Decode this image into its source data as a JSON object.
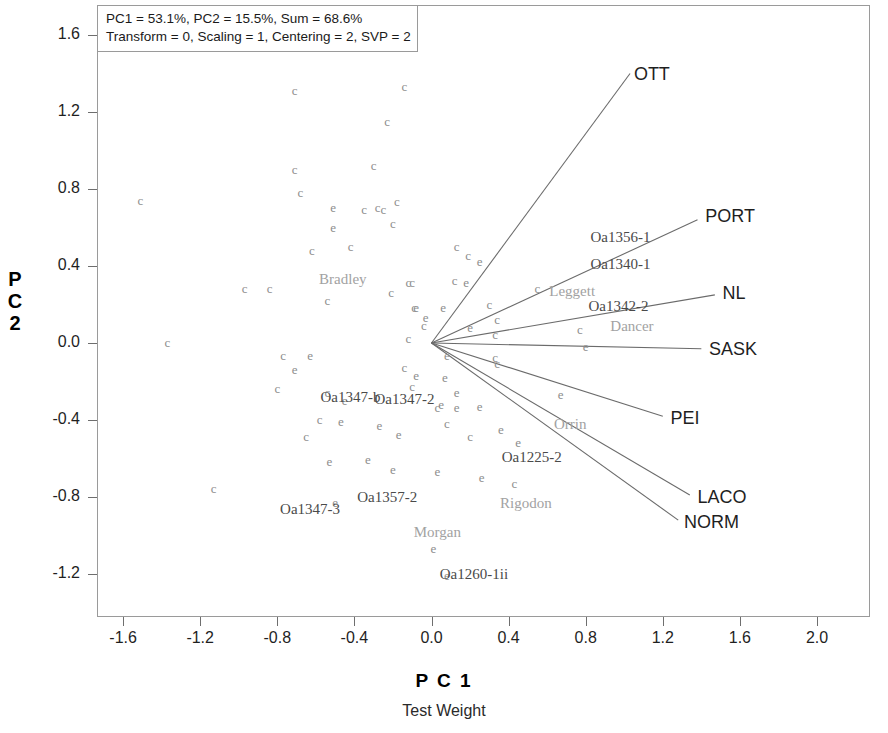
{
  "chart_data": {
    "type": "scatter",
    "title": "",
    "subtitle": "Test Weight",
    "xlabel": "P C 1",
    "ylabel": "P C 2",
    "xlim": [
      -1.85,
      2.2
    ],
    "ylim": [
      -1.42,
      1.75
    ],
    "xticks": [
      -1.6,
      -1.2,
      -0.8,
      -0.4,
      0.0,
      0.4,
      0.8,
      1.2,
      1.6,
      2.0
    ],
    "xtick_labels": [
      "-1.6",
      "-1.2",
      "-0.8",
      "-0.4",
      "0.0",
      "0.4",
      "0.8",
      "1.2",
      "1.6",
      "2.0"
    ],
    "yticks": [
      1.6,
      1.2,
      0.8,
      0.4,
      0.0,
      -0.4,
      -0.8,
      -1.2
    ],
    "ytick_labels": [
      "1.6",
      "1.2",
      "0.8",
      "0.4",
      "0.0",
      "-0.4",
      "-0.8",
      "-1.2"
    ],
    "grid": false,
    "legend": "none",
    "annotation_lines": [
      "PC1 = 53.1%, PC2 = 15.5%, Sum = 68.6%",
      "Transform = 0, Scaling = 1, Centering = 2, SVP = 2"
    ],
    "variance": {
      "pc1_percent": 53.1,
      "pc2_percent": 15.5,
      "sum_percent": 68.6
    },
    "settings": {
      "transform": 0,
      "scaling": 1,
      "centering": 2,
      "svp": 2
    },
    "vector_origin": [
      0.0,
      0.0
    ],
    "vectors": [
      {
        "name": "OTT",
        "x": 1.03,
        "y": 1.4,
        "label_x": 1.05,
        "label_y": 1.4
      },
      {
        "name": "PORT",
        "x": 1.38,
        "y": 0.64,
        "label_x": 1.42,
        "label_y": 0.66
      },
      {
        "name": "NL",
        "x": 1.47,
        "y": 0.25,
        "label_x": 1.51,
        "label_y": 0.26
      },
      {
        "name": "SASK",
        "x": 1.4,
        "y": -0.03,
        "label_x": 1.44,
        "label_y": -0.03
      },
      {
        "name": "PEI",
        "x": 1.2,
        "y": -0.38,
        "label_x": 1.24,
        "label_y": -0.39
      },
      {
        "name": "LACO",
        "x": 1.34,
        "y": -0.79,
        "label_x": 1.38,
        "label_y": -0.8
      },
      {
        "name": "NORM",
        "x": 1.28,
        "y": -0.92,
        "label_x": 1.31,
        "label_y": -0.93
      }
    ],
    "genotype_labels": [
      {
        "text": "Bradley",
        "x": -0.46,
        "y": 0.33,
        "shade": "light"
      },
      {
        "text": "Oa1356-1",
        "x": 0.98,
        "y": 0.55,
        "shade": "dark"
      },
      {
        "text": "Oa1340-1",
        "x": 0.98,
        "y": 0.41,
        "shade": "dark"
      },
      {
        "text": "Leggett",
        "x": 0.73,
        "y": 0.27,
        "shade": "light"
      },
      {
        "text": "Oa1342-2",
        "x": 0.97,
        "y": 0.19,
        "shade": "dark"
      },
      {
        "text": "Dancer",
        "x": 1.04,
        "y": 0.09,
        "shade": "light"
      },
      {
        "text": "Oa1347-b",
        "x": -0.42,
        "y": -0.28,
        "shade": "dark"
      },
      {
        "text": "Oa1347-2",
        "x": -0.14,
        "y": -0.29,
        "shade": "dark"
      },
      {
        "text": "Orrin",
        "x": 0.72,
        "y": -0.42,
        "shade": "light"
      },
      {
        "text": "Oa1225-2",
        "x": 0.52,
        "y": -0.59,
        "shade": "dark"
      },
      {
        "text": "Rigodon",
        "x": 0.49,
        "y": -0.83,
        "shade": "light"
      },
      {
        "text": "Oa1357-2",
        "x": -0.23,
        "y": -0.8,
        "shade": "dark"
      },
      {
        "text": "Oa1347-3",
        "x": -0.63,
        "y": -0.86,
        "shade": "dark"
      },
      {
        "text": "Morgan",
        "x": 0.03,
        "y": -0.98,
        "shade": "light"
      },
      {
        "text": "Oa1260-1ii",
        "x": 0.22,
        "y": -1.2,
        "shade": "dark"
      }
    ],
    "points": [
      {
        "g": "c",
        "x": -1.51,
        "y": 0.74
      },
      {
        "g": "c",
        "x": -0.71,
        "y": 1.31
      },
      {
        "g": "c",
        "x": -0.14,
        "y": 1.33
      },
      {
        "g": "c",
        "x": -0.23,
        "y": 1.15
      },
      {
        "g": "c",
        "x": -0.71,
        "y": 0.9
      },
      {
        "g": "c",
        "x": -0.3,
        "y": 0.92
      },
      {
        "g": "c",
        "x": -0.68,
        "y": 0.78
      },
      {
        "g": "c",
        "x": -0.18,
        "y": 0.73
      },
      {
        "g": "e",
        "x": -0.51,
        "y": 0.7
      },
      {
        "g": "c",
        "x": -0.28,
        "y": 0.7
      },
      {
        "g": "c",
        "x": -0.35,
        "y": 0.69
      },
      {
        "g": "c",
        "x": -0.25,
        "y": 0.69
      },
      {
        "g": "e",
        "x": -0.51,
        "y": 0.6
      },
      {
        "g": "c",
        "x": -0.2,
        "y": 0.62
      },
      {
        "g": "c",
        "x": -0.62,
        "y": 0.48
      },
      {
        "g": "c",
        "x": -0.42,
        "y": 0.5
      },
      {
        "g": "c",
        "x": 0.13,
        "y": 0.5
      },
      {
        "g": "c",
        "x": 0.19,
        "y": 0.45
      },
      {
        "g": "e",
        "x": 0.25,
        "y": 0.42
      },
      {
        "g": "c",
        "x": -0.12,
        "y": 0.31
      },
      {
        "g": "c",
        "x": -0.1,
        "y": 0.31
      },
      {
        "g": "c",
        "x": 0.12,
        "y": 0.32
      },
      {
        "g": "e",
        "x": 0.18,
        "y": 0.31
      },
      {
        "g": "c",
        "x": 0.55,
        "y": 0.28
      },
      {
        "g": "c",
        "x": -0.97,
        "y": 0.28
      },
      {
        "g": "c",
        "x": -0.84,
        "y": 0.28
      },
      {
        "g": "c",
        "x": -0.21,
        "y": 0.26
      },
      {
        "g": "c",
        "x": -0.54,
        "y": 0.22
      },
      {
        "g": "e",
        "x": -0.08,
        "y": 0.18
      },
      {
        "g": "c",
        "x": -0.09,
        "y": 0.18
      },
      {
        "g": "e",
        "x": 0.06,
        "y": 0.18
      },
      {
        "g": "c",
        "x": 0.3,
        "y": 0.2
      },
      {
        "g": "e",
        "x": -0.03,
        "y": 0.13
      },
      {
        "g": "c",
        "x": 0.34,
        "y": 0.12
      },
      {
        "g": "c",
        "x": -0.04,
        "y": 0.09
      },
      {
        "g": "e",
        "x": 0.2,
        "y": 0.08
      },
      {
        "g": "c",
        "x": 0.33,
        "y": 0.04
      },
      {
        "g": "c",
        "x": -0.12,
        "y": 0.02
      },
      {
        "g": "c",
        "x": -1.37,
        "y": 0.0
      },
      {
        "g": "c",
        "x": 0.77,
        "y": 0.07
      },
      {
        "g": "e",
        "x": 0.8,
        "y": -0.02
      },
      {
        "g": "c",
        "x": -0.77,
        "y": -0.07
      },
      {
        "g": "e",
        "x": -0.63,
        "y": -0.07
      },
      {
        "g": "e",
        "x": 0.08,
        "y": -0.07
      },
      {
        "g": "c",
        "x": 0.33,
        "y": -0.08
      },
      {
        "g": "c",
        "x": 0.34,
        "y": -0.11
      },
      {
        "g": "e",
        "x": -0.71,
        "y": -0.14
      },
      {
        "g": "c",
        "x": -0.14,
        "y": -0.13
      },
      {
        "g": "e",
        "x": -0.08,
        "y": -0.17
      },
      {
        "g": "e",
        "x": 0.07,
        "y": -0.18
      },
      {
        "g": "c",
        "x": -0.8,
        "y": -0.24
      },
      {
        "g": "e",
        "x": 0.13,
        "y": -0.26
      },
      {
        "g": "c",
        "x": -0.1,
        "y": -0.23
      },
      {
        "g": "c",
        "x": -0.54,
        "y": -0.26
      },
      {
        "g": "e",
        "x": -0.45,
        "y": -0.3
      },
      {
        "g": "e",
        "x": 0.67,
        "y": -0.27
      },
      {
        "g": "e",
        "x": 0.05,
        "y": -0.32
      },
      {
        "g": "c",
        "x": 0.03,
        "y": -0.34
      },
      {
        "g": "e",
        "x": 0.13,
        "y": -0.34
      },
      {
        "g": "e",
        "x": 0.25,
        "y": -0.33
      },
      {
        "g": "c",
        "x": -0.58,
        "y": -0.4
      },
      {
        "g": "e",
        "x": -0.47,
        "y": -0.41
      },
      {
        "g": "e",
        "x": -0.27,
        "y": -0.43
      },
      {
        "g": "c",
        "x": 0.08,
        "y": -0.42
      },
      {
        "g": "e",
        "x": 0.36,
        "y": -0.45
      },
      {
        "g": "c",
        "x": -0.65,
        "y": -0.49
      },
      {
        "g": "e",
        "x": -0.17,
        "y": -0.48
      },
      {
        "g": "c",
        "x": 0.2,
        "y": -0.49
      },
      {
        "g": "e",
        "x": 0.45,
        "y": -0.52
      },
      {
        "g": "e",
        "x": -0.53,
        "y": -0.62
      },
      {
        "g": "e",
        "x": -0.33,
        "y": -0.61
      },
      {
        "g": "e",
        "x": -0.2,
        "y": -0.66
      },
      {
        "g": "e",
        "x": 0.03,
        "y": -0.67
      },
      {
        "g": "e",
        "x": 0.26,
        "y": -0.7
      },
      {
        "g": "c",
        "x": 0.43,
        "y": -0.73
      },
      {
        "g": "c",
        "x": -1.13,
        "y": -0.76
      },
      {
        "g": "e",
        "x": -0.5,
        "y": -0.83
      },
      {
        "g": "e",
        "x": 0.01,
        "y": -1.07
      },
      {
        "g": "e",
        "x": 0.08,
        "y": -1.21
      }
    ]
  },
  "axes": {
    "x_title": "P C 1",
    "x_subtitle": "Test Weight",
    "y_title_chars": [
      "P",
      "C",
      "2"
    ]
  }
}
